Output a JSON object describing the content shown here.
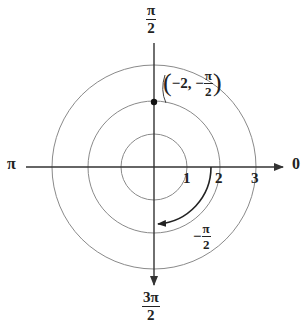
{
  "diagram": {
    "type": "polar-coordinate-plot",
    "center": {
      "x": 154,
      "y": 167
    },
    "unit_px": 33.5,
    "circles": [
      1,
      2,
      3
    ],
    "colors": {
      "circle": "#8a8a8a",
      "axis": "#333333",
      "arc": "#222222",
      "point": "#111111"
    },
    "axis_labels": {
      "top": {
        "num": "π",
        "den": "2"
      },
      "bottom": {
        "num": "3π",
        "den": "2"
      },
      "left": "π",
      "right": "0"
    },
    "radial_ticks": [
      "1",
      "2",
      "3"
    ],
    "point": {
      "label_prefix": "−2, −",
      "label_num": "π",
      "label_den": "2",
      "r": -2,
      "theta": "-π/2"
    },
    "angle_arc": {
      "label_sign": "−",
      "label_num": "π",
      "label_den": "2",
      "from": "0",
      "to": "-π/2"
    }
  }
}
